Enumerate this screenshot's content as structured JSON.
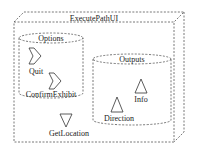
{
  "diagram": {
    "node": {
      "label": "ExecutePathUI"
    },
    "options": {
      "label": "Options",
      "items": [
        {
          "label": "Quit",
          "icon": "send-signal-icon"
        },
        {
          "label": "ConfirmExhibit",
          "icon": "send-signal-icon"
        }
      ]
    },
    "outputs": {
      "label": "Outputs",
      "items": [
        {
          "label": "Info",
          "icon": "triangle-up-icon"
        },
        {
          "label": "Direction",
          "icon": "triangle-up-icon"
        }
      ]
    },
    "get_location": {
      "label": "GetLocation",
      "icon": "triangle-down-icon"
    }
  }
}
